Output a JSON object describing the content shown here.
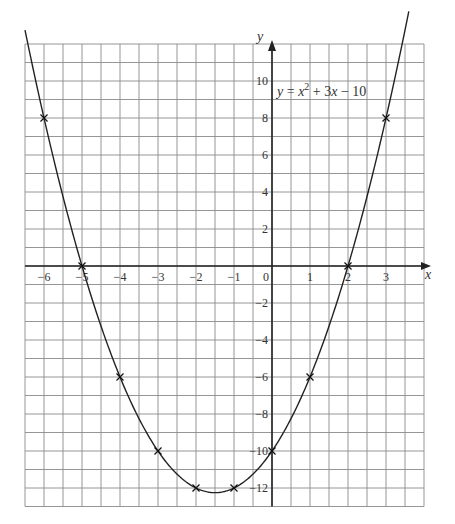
{
  "chart_data": {
    "type": "line",
    "title": "",
    "equation_label": {
      "prefix_var": "y",
      "equals": " = ",
      "x1": "x",
      "exp": "2",
      "rest_a": " + 3",
      "x2": "x",
      "rest_b": " − 10"
    },
    "xlabel": "x",
    "ylabel": "y",
    "xlim": [
      -6.5,
      4
    ],
    "ylim": [
      -13,
      12
    ],
    "grid": true,
    "grid_x_step": 0.5,
    "grid_y_step": 1,
    "x_ticks": [
      -6,
      -5,
      -4,
      -3,
      -2,
      -1,
      0,
      1,
      2,
      3
    ],
    "x_tick_labels": [
      "−6",
      "−5",
      "−4",
      "−3",
      "−2",
      "−1",
      "0",
      "1",
      "2",
      "3"
    ],
    "y_ticks": [
      10,
      8,
      6,
      4,
      2,
      -2,
      -4,
      -6,
      -8,
      -10,
      -12
    ],
    "y_tick_labels": [
      "10",
      "8",
      "6",
      "4",
      "2",
      "−2",
      "−4",
      "−6",
      "−8",
      "−10",
      "−12"
    ],
    "curve": {
      "expression": "y = x^2 + 3x - 10",
      "a": 1,
      "b": 3,
      "c": -10,
      "x_from": -6.5,
      "x_to": 3.6
    },
    "series": [
      {
        "name": "plotted points",
        "marker": "x",
        "x": [
          -6,
          -5,
          -4,
          -3,
          -2,
          -1,
          0,
          1,
          2,
          3
        ],
        "y": [
          8,
          0,
          -6,
          -10,
          -12,
          -12,
          -10,
          -6,
          0,
          8
        ]
      }
    ]
  }
}
